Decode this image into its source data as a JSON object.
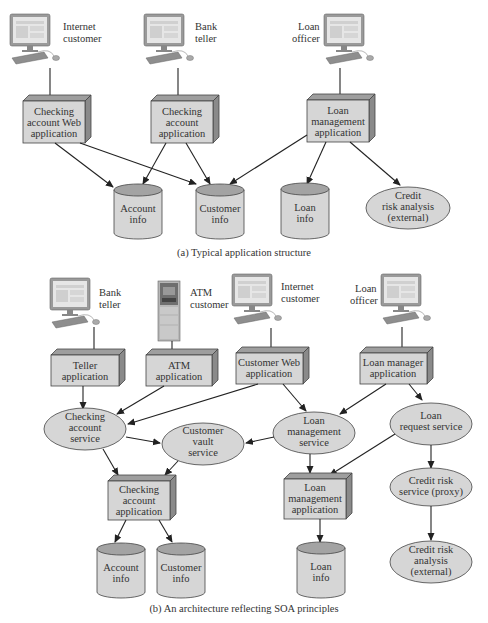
{
  "diagram_a": {
    "caption": "(a) Typical application structure",
    "users": [
      {
        "id": "internet-customer",
        "lines": [
          "Internet",
          "customer"
        ]
      },
      {
        "id": "bank-teller",
        "lines": [
          "Bank",
          "teller"
        ]
      },
      {
        "id": "loan-officer",
        "lines": [
          "Loan",
          "officer"
        ]
      }
    ],
    "applications": [
      {
        "id": "checking-web-app",
        "lines": [
          "Checking",
          "account Web",
          "application"
        ]
      },
      {
        "id": "checking-app",
        "lines": [
          "Checking",
          "account",
          "application"
        ]
      },
      {
        "id": "loan-mgmt-app",
        "lines": [
          "Loan",
          "management",
          "application"
        ]
      }
    ],
    "datastores": [
      {
        "id": "account-info",
        "lines": [
          "Account",
          "info"
        ]
      },
      {
        "id": "customer-info",
        "lines": [
          "Customer",
          "info"
        ]
      },
      {
        "id": "loan-info",
        "lines": [
          "Loan",
          "info"
        ]
      }
    ],
    "external": [
      {
        "id": "credit-risk-ext",
        "lines": [
          "Credit",
          "risk analysis",
          "(external)"
        ]
      }
    ]
  },
  "diagram_b": {
    "caption": "(b) An architecture reflecting SOA principles",
    "users": [
      {
        "id": "bank-teller",
        "lines": [
          "Bank",
          "teller"
        ]
      },
      {
        "id": "atm-customer",
        "lines": [
          "ATM",
          "customer"
        ]
      },
      {
        "id": "internet-customer",
        "lines": [
          "Internet",
          "customer"
        ]
      },
      {
        "id": "loan-officer",
        "lines": [
          "Loan",
          "officer"
        ]
      }
    ],
    "applications": [
      {
        "id": "teller-app",
        "lines": [
          "Teller",
          "application"
        ]
      },
      {
        "id": "atm-app",
        "lines": [
          "ATM",
          "application"
        ]
      },
      {
        "id": "customer-web-app",
        "lines": [
          "Customer Web",
          "application"
        ]
      },
      {
        "id": "loan-manager-app",
        "lines": [
          "Loan manager",
          "application"
        ]
      }
    ],
    "services": [
      {
        "id": "checking-account-service",
        "lines": [
          "Checking",
          "account",
          "service"
        ]
      },
      {
        "id": "customer-vault-service",
        "lines": [
          "Customer",
          "vault",
          "service"
        ]
      },
      {
        "id": "loan-management-service",
        "lines": [
          "Loan",
          "management",
          "service"
        ]
      },
      {
        "id": "loan-request-service",
        "lines": [
          "Loan",
          "request service"
        ]
      },
      {
        "id": "credit-risk-proxy",
        "lines": [
          "Credit risk",
          "service (proxy)"
        ]
      },
      {
        "id": "credit-risk-ext",
        "lines": [
          "Credit risk",
          "analysis",
          "(external)"
        ]
      }
    ],
    "backends": [
      {
        "id": "checking-account-app",
        "lines": [
          "Checking",
          "account",
          "application"
        ]
      },
      {
        "id": "loan-management-app",
        "lines": [
          "Loan",
          "management",
          "application"
        ]
      }
    ],
    "datastores": [
      {
        "id": "account-info",
        "lines": [
          "Account",
          "info"
        ]
      },
      {
        "id": "customer-info",
        "lines": [
          "Customer",
          "info"
        ]
      },
      {
        "id": "loan-info",
        "lines": [
          "Loan",
          "info"
        ]
      }
    ]
  },
  "colors": {
    "node_fill": "#d6d6d6",
    "node_top": "#9e9e9e",
    "stroke": "#444444",
    "text": "#333333"
  }
}
